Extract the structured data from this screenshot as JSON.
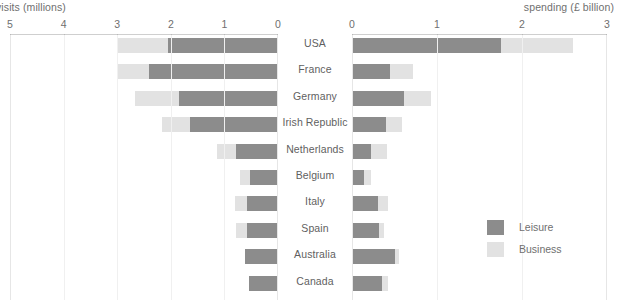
{
  "chart_data": {
    "type": "bar",
    "orientation": "horizontal",
    "layout": "butterfly/back-to-back stacked bar (population pyramid style)",
    "categories": [
      "USA",
      "France",
      "Germany",
      "Irish Republic",
      "Netherlands",
      "Belgium",
      "Italy",
      "Spain",
      "Australia",
      "Canada"
    ],
    "panels": [
      {
        "id": "visits",
        "title": "visits (millions)",
        "xlabel": "visits (millions)",
        "ylabel": "",
        "direction": "right-to-left",
        "xlim": [
          5,
          0
        ],
        "ticks": [
          5,
          4,
          3,
          2,
          1,
          0
        ],
        "grid": true,
        "stacked": true,
        "series": [
          {
            "name": "Leisure",
            "color": "#8c8c8c",
            "values": [
              2.05,
              2.4,
              1.85,
              1.65,
              0.78,
              0.52,
              0.58,
              0.58,
              0.62,
              0.55
            ]
          },
          {
            "name": "Business",
            "color": "#e2e2e2",
            "values": [
              0.95,
              0.58,
              0.82,
              0.52,
              0.35,
              0.18,
              0.22,
              0.2,
              0.0,
              0.0
            ]
          }
        ],
        "totals": [
          3.0,
          2.98,
          2.67,
          2.17,
          1.13,
          0.7,
          0.8,
          0.78,
          0.62,
          0.55
        ]
      },
      {
        "id": "spending",
        "title": "spending (£ billion)",
        "xlabel": "spending (£ billion)",
        "ylabel": "",
        "direction": "left-to-right",
        "xlim": [
          0,
          3
        ],
        "ticks": [
          0,
          1,
          2,
          3
        ],
        "grid": true,
        "stacked": true,
        "series": [
          {
            "name": "Leisure",
            "color": "#8c8c8c",
            "values": [
              1.75,
              0.45,
              0.61,
              0.4,
              0.22,
              0.14,
              0.31,
              0.32,
              0.5,
              0.35
            ]
          },
          {
            "name": "Business",
            "color": "#e2e2e2",
            "values": [
              0.85,
              0.27,
              0.32,
              0.19,
              0.19,
              0.08,
              0.11,
              0.06,
              0.05,
              0.07
            ]
          }
        ],
        "totals": [
          2.6,
          0.72,
          0.93,
          0.59,
          0.41,
          0.22,
          0.42,
          0.38,
          0.55,
          0.42
        ]
      }
    ],
    "legend": {
      "position": "bottom-right",
      "entries": [
        {
          "label": "Leisure",
          "color": "#8c8c8c"
        },
        {
          "label": "Business",
          "color": "#e2e2e2"
        }
      ]
    },
    "colors": {
      "leisure": "#8c8c8c",
      "business": "#e2e2e2",
      "axis": "#cfcfcf",
      "grid": "#f0f0f0",
      "text": "#6f6f6f",
      "background": "#ffffff"
    }
  }
}
